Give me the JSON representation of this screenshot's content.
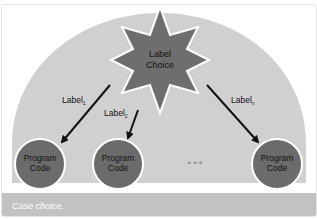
{
  "diagram": {
    "title_node": {
      "line1": "Label",
      "line2": "Choice"
    },
    "labels": [
      {
        "text": "Label",
        "sub": "1"
      },
      {
        "text": "Label",
        "sub": "2"
      },
      {
        "text": "Label",
        "sub": "n"
      }
    ],
    "nodes": [
      {
        "line1": "Program",
        "line2": "Code"
      },
      {
        "line1": "Program",
        "line2": "Code"
      },
      {
        "line1": "Program",
        "line2": "Code"
      }
    ],
    "ellipsis": "• • •",
    "colors": {
      "dome": "#d0d0d0",
      "star": "#6e6e6e",
      "node": "#6b6b6b",
      "outline": "#ffffff",
      "arrow": "#111111",
      "caption_bg": "#c2c2c2"
    }
  },
  "caption": {
    "text": "Case choice."
  }
}
